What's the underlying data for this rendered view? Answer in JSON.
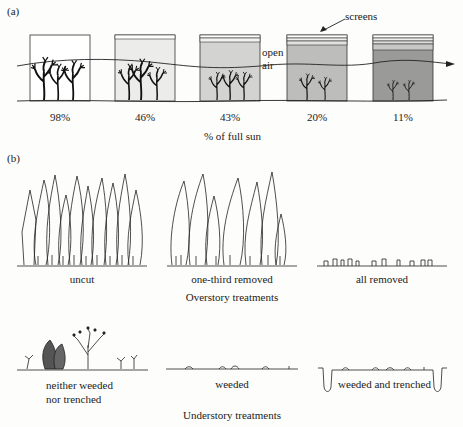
{
  "figure": {
    "panel_a": {
      "label": "(a)",
      "screens_label": "screens",
      "open_air_label_1": "open",
      "open_air_label_2": "air",
      "axis_caption": "% of full sun",
      "boxes": [
        {
          "pct": "98%",
          "screens": 0,
          "fill": "#ffffff"
        },
        {
          "pct": "46%",
          "screens": 1,
          "fill": "#ececea"
        },
        {
          "pct": "43%",
          "screens": 2,
          "fill": "#d3d3d1"
        },
        {
          "pct": "20%",
          "screens": 3,
          "fill": "#bdbdbb"
        },
        {
          "pct": "11%",
          "screens": 4,
          "fill": "#9a9a98"
        }
      ]
    },
    "panel_b": {
      "label": "(b)",
      "overstory": {
        "caption": "Overstory treatments",
        "items": [
          {
            "label": "uncut"
          },
          {
            "label": "one-third removed"
          },
          {
            "label": "all removed"
          }
        ]
      },
      "understory": {
        "caption": "Understory treatments",
        "items": [
          {
            "label_line1": "neither weeded",
            "label_line2": "nor trenched"
          },
          {
            "label_line1": "weeded"
          },
          {
            "label_line1": "weeded and trenched"
          }
        ]
      }
    }
  }
}
